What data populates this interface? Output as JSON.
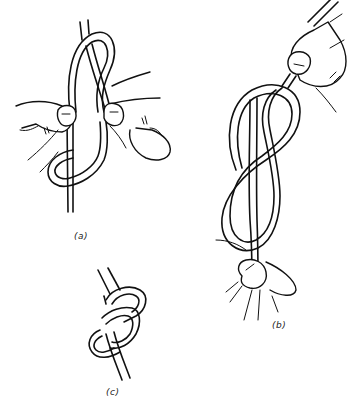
{
  "figure": {
    "panels": [
      {
        "id": "a",
        "label": "(a)",
        "description": "two hands forming the loop and passing the end around the standing part"
      },
      {
        "id": "b",
        "label": "(b)",
        "description": "knot held between thumb and finger at top and bottom, figure-eight shape elongated"
      },
      {
        "id": "c",
        "label": "(c)",
        "description": "finished figure-eight knot, tightened"
      }
    ]
  },
  "colors": {
    "line": "#111111",
    "background": "#ffffff"
  }
}
